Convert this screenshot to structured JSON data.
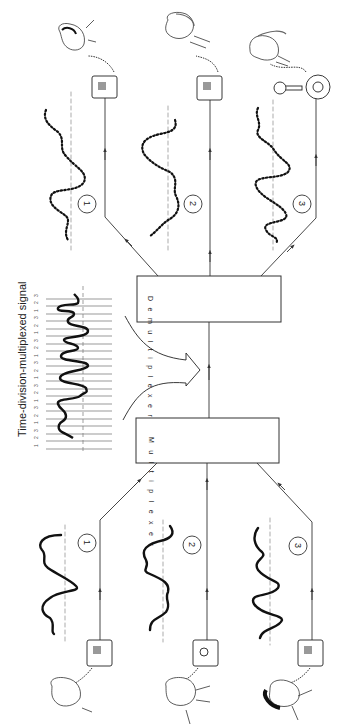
{
  "diagram": {
    "title": "Time-division-multiplexed signal",
    "multiplexer_label": "Multiplexer",
    "demultiplexer_label": "Demultiplexer",
    "slot_sequence": [
      "1",
      "2",
      "3",
      "1",
      "2",
      "3",
      "1",
      "2",
      "3",
      "1",
      "2",
      "3",
      "1",
      "2",
      "3",
      "1",
      "2",
      "3",
      "1",
      "2",
      "3",
      "1"
    ],
    "channels": [
      {
        "id": "1",
        "label": "1",
        "sender_phone": "push-button",
        "receiver_phone": "push-button"
      },
      {
        "id": "2",
        "label": "2",
        "sender_phone": "rotary-dial",
        "receiver_phone": "push-button"
      },
      {
        "id": "3",
        "label": "3",
        "sender_phone": "push-button",
        "receiver_phone": "candlestick-rotary"
      }
    ],
    "colors": {
      "ink": "#1a1a1a",
      "line": "#333333",
      "dash": "#888888",
      "background": "#ffffff"
    },
    "orientation": "rotated-90-ccw",
    "flow": "senders (bottom) -> multiplexer -> TDM link -> demultiplexer -> receivers (top)"
  }
}
